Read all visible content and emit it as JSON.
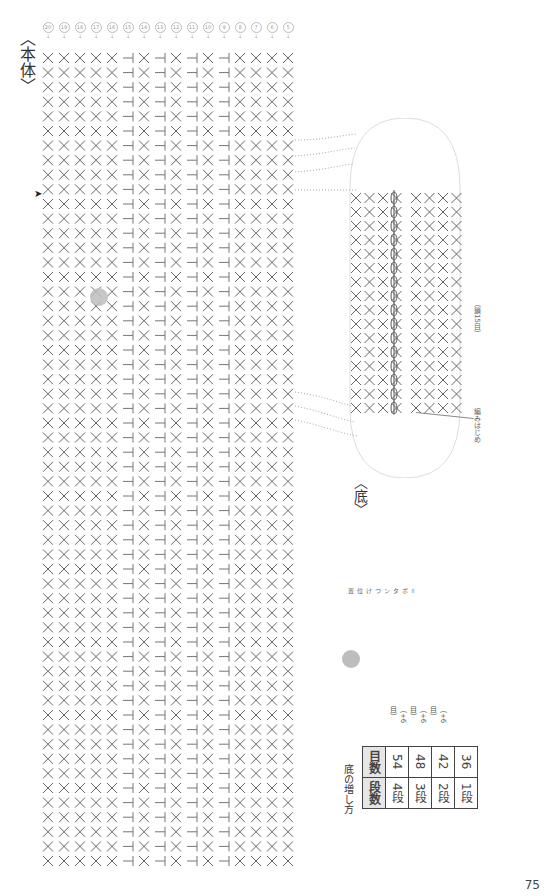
{
  "page": {
    "page_number": "75"
  },
  "main_body": {
    "title": "〈本体〉",
    "row_numbers": [
      "20",
      "19",
      "18",
      "17",
      "16",
      "15",
      "14",
      "13",
      "12",
      "11",
      "10",
      "9",
      "8",
      "7",
      "6",
      "5"
    ],
    "button_marker_note": "gray dot marks button position"
  },
  "base": {
    "title": "〈底〉",
    "start_label": "編みはじめ",
    "chain_label": "（鎖15目）",
    "round_numbers": [
      "4",
      "3",
      "2",
      "1"
    ]
  },
  "legend": {
    "button_label": "＝ボタンつけ位置",
    "button_color": "#bdbdbd"
  },
  "increase_table": {
    "title": "底の増し方",
    "headers": [
      "段数",
      "目数"
    ],
    "rows": [
      {
        "round": "4段",
        "stitches": "54",
        "note": "（+6目）"
      },
      {
        "round": "3段",
        "stitches": "48",
        "note": "（+6目）"
      },
      {
        "round": "2段",
        "stitches": "42",
        "note": "（+6目）"
      },
      {
        "round": "1段",
        "stitches": "36",
        "note": ""
      }
    ]
  },
  "symbols": {
    "sc": "×",
    "hdc": "T",
    "inc": "≪",
    "chain": "○"
  }
}
